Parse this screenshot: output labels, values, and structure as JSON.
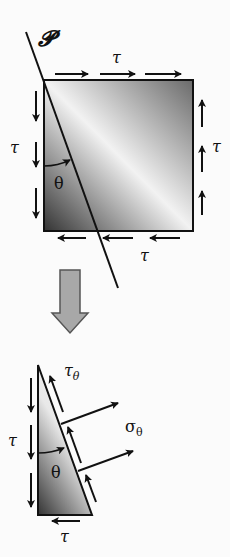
{
  "labels": {
    "plane": "𝓟",
    "tau_top": "τ",
    "tau_left": "τ",
    "tau_right": "τ",
    "tau_bottom": "τ",
    "theta_top": "θ",
    "tau_theta_main": "τ",
    "tau_theta_sub": "θ",
    "sigma_theta_main": "σ",
    "sigma_theta_sub": "θ",
    "tau_left_lower": "τ",
    "theta_lower": "θ",
    "tau_bottom_lower": "τ"
  },
  "colors": {
    "stroke": "#111111",
    "gradient_dark": "#3a3a3a",
    "gradient_light": "#f4f4f4",
    "big_arrow": "#a8a8a8"
  }
}
